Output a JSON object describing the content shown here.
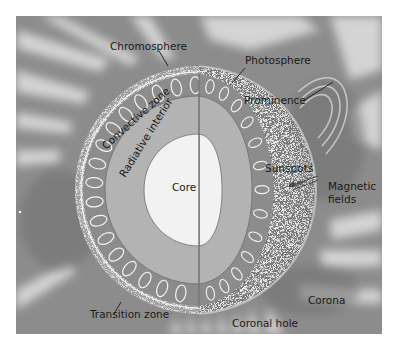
{
  "figure": {
    "type": "cutaway-diagram",
    "colors": {
      "background_page": "#ffffff",
      "corona_background": "#8a8a8a",
      "corona_streamers": "#d8d8d8",
      "convective_zone": "#8c8c8c",
      "radiative_interior": "#b3b3b3",
      "core": "#f2f2f2",
      "photosphere_surface": "#f4f4f4",
      "chromosphere_rim": "#e6e6e6",
      "label_text": "#1a1a1a"
    }
  },
  "labels": {
    "chromosphere": "Chromosphere",
    "photosphere": "Photosphere",
    "prominence": "Prominence",
    "convective_zone": "Convective zone",
    "radiative_interior": "Radiative interior",
    "core": "Core",
    "sunspots": "Sunspots",
    "magnetic_fields_line1": "Magnetic",
    "magnetic_fields_line2": "fields",
    "corona": "Corona",
    "transition_zone": "Transition zone",
    "coronal_hole": "Coronal hole"
  }
}
